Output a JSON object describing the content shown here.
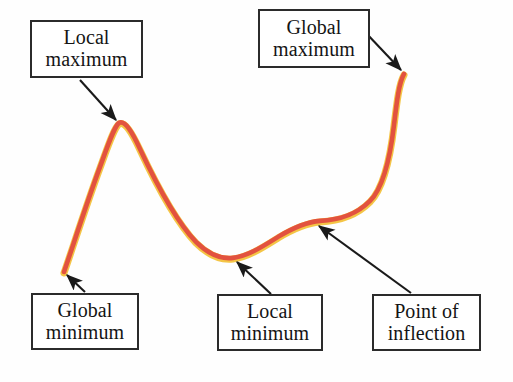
{
  "figure": {
    "background_color": "#fefefe",
    "width": 513,
    "height": 382
  },
  "curve": {
    "name": "annotated-function-curve",
    "stroke_color": "#e2523f",
    "highlight_color": "#f3c23c",
    "stroke_width": 5,
    "path": "M 64 273 C 72 250 86 206 100 168 C 108 146 114 128 119 124 C 125 121 132 133 140 150 C 155 182 176 222 196 243 C 211 258 224 260 233 259 C 248 257 262 248 278 238 C 293 229 306 223 320 222 C 340 221 356 216 370 202 C 383 189 390 160 394 126 C 397 101 399 84 404 75"
  },
  "callouts": [
    {
      "id": "local-maximum",
      "lines": [
        "Local",
        "maximum"
      ],
      "arrow": {
        "from": [
          80,
          80
        ],
        "to": [
          116,
          120
        ]
      }
    },
    {
      "id": "global-maximum",
      "lines": [
        "Global",
        "maximum"
      ],
      "arrow": {
        "from": [
          366,
          33
        ],
        "to": [
          401,
          70
        ]
      }
    },
    {
      "id": "global-minimum",
      "lines": [
        "Global",
        "minimum"
      ],
      "arrow": {
        "from": [
          85,
          292
        ],
        "to": [
          67,
          275
        ]
      }
    },
    {
      "id": "local-minimum",
      "lines": [
        "Local",
        "minimum"
      ],
      "arrow": {
        "from": [
          271,
          294
        ],
        "to": [
          237,
          262
        ]
      }
    },
    {
      "id": "point-of-inflection",
      "lines": [
        "Point of",
        "inflection"
      ],
      "arrow": {
        "from": [
          411,
          293
        ],
        "to": [
          319,
          226
        ]
      }
    }
  ],
  "chart_data": {
    "type": "line",
    "title": "",
    "xlabel": "",
    "ylabel": "",
    "grid": false,
    "legend": "none",
    "annotations": [
      {
        "label": "Local maximum",
        "point_px": [
          119,
          124
        ]
      },
      {
        "label": "Global maximum",
        "point_px": [
          404,
          75
        ]
      },
      {
        "label": "Global minimum",
        "point_px": [
          64,
          273
        ]
      },
      {
        "label": "Local minimum",
        "point_px": [
          233,
          259
        ]
      },
      {
        "label": "Point of inflection",
        "point_px": [
          320,
          222
        ]
      }
    ],
    "series": [
      {
        "name": "f(x)",
        "x": [
          64,
          80,
          100,
          119,
          140,
          165,
          196,
          215,
          233,
          255,
          278,
          300,
          320,
          345,
          370,
          385,
          394,
          400,
          404
        ],
        "y": [
          273,
          232,
          168,
          124,
          150,
          196,
          243,
          255,
          259,
          252,
          238,
          228,
          222,
          220,
          202,
          170,
          126,
          96,
          75
        ]
      }
    ]
  }
}
